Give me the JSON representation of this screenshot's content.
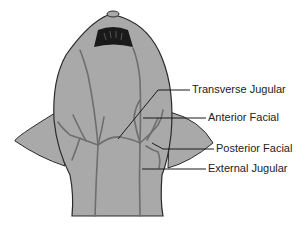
{
  "diagram": {
    "labels": [
      {
        "id": "transverse-jugular",
        "text": "Transverse Jugular",
        "x": 192,
        "y": 85
      },
      {
        "id": "anterior-facial",
        "text": "Anterior Facial",
        "x": 208,
        "y": 113
      },
      {
        "id": "posterior-facial",
        "text": "Posterior Facial",
        "x": 216,
        "y": 144
      },
      {
        "id": "external-jugular",
        "text": "External Jugular",
        "x": 208,
        "y": 164
      }
    ],
    "colors": {
      "body_fill": "#a9a9a9",
      "outline": "#2a2a2a",
      "vein": "#6e6e6e",
      "mouth": "#1a1a1a"
    }
  }
}
